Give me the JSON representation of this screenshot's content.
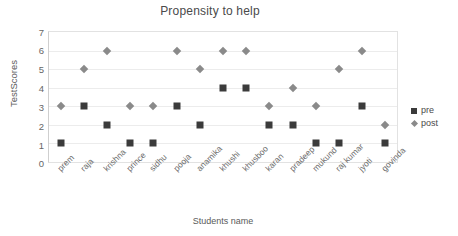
{
  "chart_data": {
    "type": "scatter",
    "title": "Propensity to help",
    "xlabel": "Students name",
    "ylabel": "TestScores",
    "categories": [
      "prem",
      "raja",
      "krishna",
      "prince",
      "sidhu",
      "pooja",
      "anamika",
      "khushi",
      "khusboo",
      "karan",
      "pradeep",
      "mukund",
      "raj kumar",
      "jyoti",
      "govinda"
    ],
    "series": [
      {
        "name": "pre",
        "color": "#3b3b3b",
        "marker": "square",
        "values": [
          1,
          3,
          2,
          1,
          1,
          3,
          2,
          4,
          4,
          2,
          2,
          1,
          1,
          3,
          1
        ]
      },
      {
        "name": "post",
        "color": "#8a8a8a",
        "marker": "diamond",
        "values": [
          3,
          5,
          6,
          3,
          3,
          6,
          5,
          6,
          6,
          3,
          4,
          3,
          5,
          6,
          2
        ]
      }
    ],
    "yticks": [
      0,
      1,
      2,
      3,
      4,
      5,
      6,
      7
    ],
    "ylim": [
      0,
      7
    ],
    "grid": "horizontal",
    "legend_position": "right"
  },
  "yticks": {
    "t0": "0",
    "t1": "1",
    "t2": "2",
    "t3": "3",
    "t4": "4",
    "t5": "5",
    "t6": "6",
    "t7": "7"
  },
  "legend": {
    "pre_label": "pre",
    "post_label": "post"
  }
}
